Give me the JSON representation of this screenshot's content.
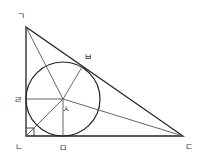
{
  "diagram": {
    "type": "right triangle with inscribed circle",
    "vertices": {
      "A": {
        "label": "ㄱ",
        "x": 26,
        "y": 27
      },
      "B": {
        "label": "ㄴ",
        "x": 26,
        "y": 136
      },
      "C": {
        "label": "ㄷ",
        "x": 183,
        "y": 136
      }
    },
    "incenter": {
      "label": "ㅅ",
      "x": 63,
      "y": 99,
      "radius": 37
    },
    "tangent_points": {
      "on_AB": {
        "label": "ㄹ",
        "x": 26,
        "y": 99
      },
      "on_BC": {
        "label": "ㅁ",
        "x": 63,
        "y": 136
      },
      "on_AC": {
        "label": "ㅂ",
        "x": 82,
        "y": 67
      }
    },
    "labels": {
      "a": "ㄱ",
      "b": "ㄴ",
      "c": "ㄷ",
      "d": "ㄹ",
      "e": "ㅁ",
      "f": "ㅂ",
      "g": "ㅅ"
    },
    "colors": {
      "stroke": "#222222",
      "thin_stroke": "#555555"
    }
  }
}
